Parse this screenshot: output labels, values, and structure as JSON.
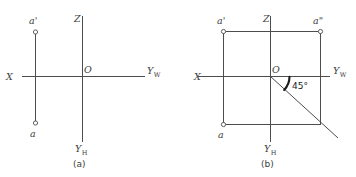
{
  "figure": {
    "background_color": "#ffffff",
    "line_color": "#4d4d4d",
    "text_color": "#3d3d3d",
    "accent_color": "#1a1a1a"
  },
  "panel_a": {
    "caption": "(a)",
    "labels": {
      "x_axis": "X",
      "z_axis": "Z",
      "origin": "O",
      "yw_axis": "Y",
      "yw_sub": "W",
      "yh_axis": "Y",
      "yh_sub": "H",
      "point_front": "a'",
      "point_top": "a"
    }
  },
  "panel_b": {
    "caption": "(b)",
    "labels": {
      "x_axis": "X",
      "z_axis": "Z",
      "origin": "O",
      "yw_axis": "Y",
      "yw_sub": "W",
      "yh_axis": "Y",
      "yh_sub": "H",
      "point_front": "a'",
      "point_side": "a\"",
      "point_top": "a",
      "angle": "45°"
    }
  }
}
